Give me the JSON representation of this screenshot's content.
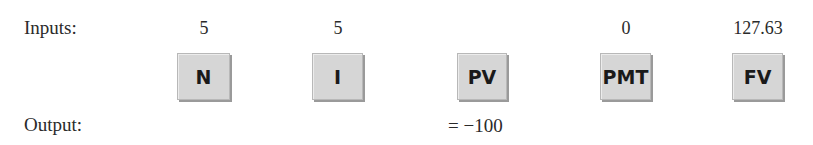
{
  "labels": {
    "inputs": "Inputs:",
    "output": "Output:"
  },
  "keys": [
    {
      "label": "N",
      "input": "5"
    },
    {
      "label": "I",
      "input": "5"
    },
    {
      "label": "PV",
      "input": ""
    },
    {
      "label": "PMT",
      "input": "0"
    },
    {
      "label": "FV",
      "input": "127.63"
    }
  ],
  "output": {
    "value": "= −100"
  }
}
